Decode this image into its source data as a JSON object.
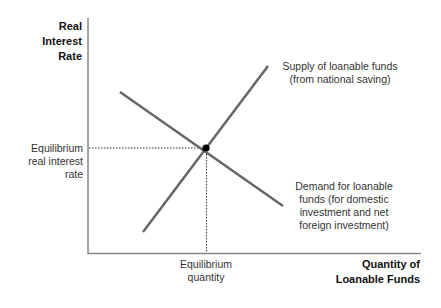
{
  "diagram": {
    "y_axis_label": [
      "Real",
      "Interest",
      "Rate"
    ],
    "x_axis_label": [
      "Quantity of",
      "Loanable Funds"
    ],
    "equilibrium_rate_label": [
      "Equilibrium",
      "real interest",
      "rate"
    ],
    "equilibrium_quantity_label": [
      "Equilibrium",
      "quantity"
    ],
    "supply_label": [
      "Supply of loanable funds",
      "(from national saving)"
    ],
    "demand_label": [
      "Demand for loanable",
      "funds (for domestic",
      "investment and net",
      "foreign investment)"
    ],
    "colors": {
      "curve": "#666666",
      "axis": "#888888",
      "point": "#000000",
      "guide": "#333333"
    }
  }
}
